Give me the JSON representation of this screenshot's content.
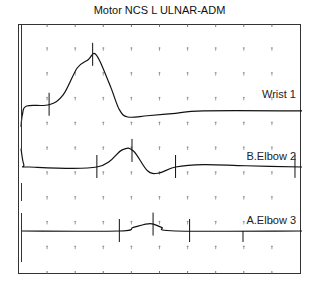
{
  "chart_data": {
    "type": "line",
    "title": "Motor NCS L ULNAR-ADM",
    "xlabel": "",
    "ylabel": "",
    "grid": "dotted tick marks",
    "x_divisions": 10,
    "y_divisions": 10,
    "traces": [
      {
        "name": "Wrist 1",
        "label": "Wrist 1",
        "points": [
          [
            0,
            -0.4
          ],
          [
            0.05,
            0.1
          ],
          [
            0.2,
            0.45
          ],
          [
            1,
            0.5
          ],
          [
            1.5,
            0.9
          ],
          [
            2,
            2.0
          ],
          [
            2.4,
            2.35
          ],
          [
            2.6,
            2.6
          ],
          [
            2.8,
            2.3
          ],
          [
            3.2,
            1.2
          ],
          [
            3.5,
            0.3
          ],
          [
            3.8,
            0.0
          ],
          [
            4.5,
            0.05
          ],
          [
            5.5,
            0.15
          ],
          [
            6.5,
            0.25
          ],
          [
            10,
            0.25
          ]
        ],
        "markers": [
          1.0,
          2.55
        ]
      },
      {
        "name": "B.Elbow 2",
        "label": "B.Elbow 2",
        "points": [
          [
            0,
            0.75
          ],
          [
            0.1,
            0.1
          ],
          [
            0.3,
            0.0
          ],
          [
            2.7,
            0.0
          ],
          [
            3.6,
            0.7
          ],
          [
            4.0,
            0.65
          ],
          [
            4.5,
            -0.15
          ],
          [
            4.9,
            -0.25
          ],
          [
            5.5,
            0.0
          ],
          [
            6.5,
            0.1
          ],
          [
            8,
            0.05
          ],
          [
            10,
            0.0
          ]
        ],
        "markers": [
          2.7,
          3.95,
          5.5,
          9.75
        ]
      },
      {
        "name": "A.Elbow 3",
        "label": "A.Elbow 3",
        "points": [
          [
            0,
            0.0
          ],
          [
            3.5,
            0.0
          ],
          [
            4.0,
            0.15
          ],
          [
            4.6,
            0.3
          ],
          [
            5.0,
            0.15
          ],
          [
            5.5,
            0.0
          ],
          [
            10,
            0.0
          ]
        ],
        "markers": [
          3.5,
          4.7,
          6.0,
          7.9
        ]
      }
    ]
  }
}
